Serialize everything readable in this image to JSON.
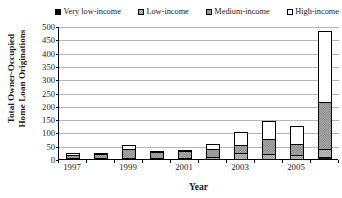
{
  "chart_data": {
    "type": "bar",
    "subtype": "stacked-bar",
    "title": "",
    "xlabel": "Year",
    "ylabel": "Total Owner-Occupied Home Loan Originations",
    "ylabel_line1": "Total Owner-Occupied",
    "ylabel_line2": "Home Loan Originations",
    "categories": [
      "1997",
      "1998",
      "1999",
      "2000",
      "2001",
      "2002",
      "2003",
      "2004",
      "2005",
      "2006"
    ],
    "tick_labels_shown": [
      "1997",
      "1999",
      "2001",
      "2003",
      "2005"
    ],
    "ylim": [
      0,
      500
    ],
    "yticks": [
      0,
      50,
      100,
      150,
      200,
      250,
      300,
      350,
      400,
      450,
      500
    ],
    "ytick_labels": [
      "0",
      "50",
      "100",
      "150",
      "200",
      "250",
      "300",
      "350",
      "400",
      "450",
      "500"
    ],
    "grid": true,
    "grid_axis": "y",
    "legend_position": "top",
    "series": [
      {
        "name": "Very low-income",
        "color": "#1a1a1a",
        "pattern": "solid-black",
        "values": [
          0,
          0,
          0,
          0,
          0,
          0,
          0,
          0,
          0,
          10
        ]
      },
      {
        "name": "Low-income",
        "color": "#c4c4c4",
        "pattern": "light-checker",
        "values": [
          3,
          4,
          7,
          5,
          5,
          10,
          28,
          22,
          17,
          30
        ]
      },
      {
        "name": "Medium-income",
        "color": "#bfbfbf",
        "pattern": "dense-checker",
        "values": [
          12,
          14,
          33,
          22,
          25,
          30,
          27,
          56,
          43,
          180
        ]
      },
      {
        "name": "High-income",
        "color": "#ffffff",
        "pattern": "white",
        "values": [
          5,
          3,
          15,
          6,
          7,
          21,
          52,
          70,
          69,
          265
        ]
      }
    ],
    "totals": [
      20,
      21,
      55,
      33,
      37,
      61,
      107,
      148,
      129,
      485
    ]
  },
  "legend": {
    "items": [
      {
        "label": "Very low-income",
        "swatch": "sw-verylow"
      },
      {
        "label": "Low-income",
        "swatch": "sw-low"
      },
      {
        "label": "Medium-income",
        "swatch": "sw-med"
      },
      {
        "label": "High-income",
        "swatch": "sw-high"
      }
    ]
  }
}
